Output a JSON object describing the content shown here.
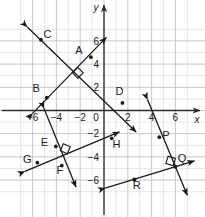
{
  "figure": {
    "background_color": "#ffffff",
    "line_color": "#1a1a1a",
    "grid_minor_color": "#d9d9de",
    "grid_major_color": "#b9b9c1",
    "axis_color": "#2b2b2b"
  },
  "chart_data": {
    "type": "scatter",
    "title": "",
    "xlabel": "x",
    "ylabel": "y",
    "xlim": [
      -7.4,
      7.8
    ],
    "ylim": [
      -7.6,
      7.4
    ],
    "grid": true,
    "grid_step": 1,
    "grid_major_step": 2,
    "legend": "none",
    "x_ticks": [
      -6,
      -4,
      -2,
      0,
      2,
      4,
      6
    ],
    "y_ticks": [
      6,
      4,
      2,
      0,
      -2,
      -4,
      -6
    ],
    "x_tick_labels": [
      "−6",
      "−4",
      "−2",
      "0",
      "2",
      "4",
      "6"
    ],
    "y_tick_labels": [
      "6",
      "4",
      "2",
      "−2",
      "−4",
      "−6"
    ],
    "origin_label": "0",
    "points": [
      {
        "name": "A",
        "label": "A",
        "x": -1.1,
        "y": 4.6,
        "label_dx": -1.0,
        "label_dy": 0.6
      },
      {
        "name": "B",
        "label": "B",
        "x": -4.8,
        "y": 1.1,
        "label_dx": -0.9,
        "label_dy": 0.85
      },
      {
        "name": "C",
        "label": "C",
        "x": -5.3,
        "y": 6.1,
        "label_dx": 0.55,
        "label_dy": 0.5
      },
      {
        "name": "D",
        "label": "D",
        "x": 1.55,
        "y": 0.65,
        "label_dx": -0.25,
        "label_dy": 1.0
      },
      {
        "name": "E",
        "label": "E",
        "x": -4.05,
        "y": -3.1,
        "label_dx": -0.95,
        "label_dy": 0.35
      },
      {
        "name": "F",
        "label": "F",
        "x": -3.55,
        "y": -4.75,
        "label_dx": -0.15,
        "label_dy": -0.35
      },
      {
        "name": "G",
        "label": "G",
        "x": -5.6,
        "y": -4.5,
        "label_dx": -0.85,
        "label_dy": 0.3
      },
      {
        "name": "H",
        "label": "H",
        "x": 0.65,
        "y": -2.4,
        "label_dx": 0.4,
        "label_dy": -0.45
      },
      {
        "name": "P",
        "label": "P",
        "x": 4.65,
        "y": -2.3,
        "label_dx": 0.55,
        "label_dy": 0.15
      },
      {
        "name": "Q",
        "label": "Q",
        "x": 6.0,
        "y": -4.85,
        "label_dx": 0.55,
        "label_dy": 0.75
      },
      {
        "name": "R",
        "label": "R",
        "x": 2.55,
        "y": -5.95,
        "label_dx": 0.2,
        "label_dy": -0.45
      }
    ],
    "lines": [
      {
        "name": "line-CD",
        "through_labels": [
          "C",
          "D"
        ],
        "x1": -6.45,
        "y1": 7.2,
        "x2": 2.7,
        "y2": -1.85,
        "arrow_start": true,
        "arrow_end": true
      },
      {
        "name": "line-AB",
        "through_labels": [
          "A",
          "B"
        ],
        "x1": -6.0,
        "y1": -0.25,
        "x2": 0.2,
        "y2": 6.3,
        "arrow_start": true,
        "arrow_end": true
      },
      {
        "name": "line-EF",
        "through_labels": [
          "E",
          "F"
        ],
        "x1": -5.05,
        "y1": 0.2,
        "x2": -2.35,
        "y2": -6.6,
        "arrow_start": true,
        "arrow_end": true
      },
      {
        "name": "line-GH",
        "through_labels": [
          "G",
          "H"
        ],
        "x1": -6.65,
        "y1": -5.25,
        "x2": 1.3,
        "y2": -1.85,
        "arrow_start": true,
        "arrow_end": true
      },
      {
        "name": "line-PQ",
        "through_labels": [
          "P",
          "Q"
        ],
        "x1": 3.65,
        "y1": 0.95,
        "x2": 7.0,
        "y2": -7.3,
        "arrow_start": true,
        "arrow_end": true
      },
      {
        "name": "line-R",
        "through_labels": [
          "R",
          "Q"
        ],
        "x1": 0.1,
        "y1": -6.7,
        "x2": 7.6,
        "y2": -4.35,
        "arrow_start": true,
        "arrow_end": true
      }
    ],
    "right_angles": [
      {
        "name": "right-angle-AB-CD",
        "x": -2.2,
        "y": 3.25,
        "angle_deg": -45
      },
      {
        "name": "right-angle-EF-GH",
        "x": -3.25,
        "y": -3.3,
        "angle_deg": 23
      },
      {
        "name": "right-angle-PQ-R",
        "x": 5.6,
        "y": -4.35,
        "angle_deg": 17
      }
    ]
  }
}
